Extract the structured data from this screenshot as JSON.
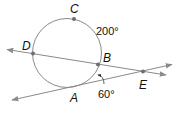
{
  "diagram": {
    "type": "circle with secant and tangent lines",
    "points": {
      "A": {
        "label": "A",
        "role": "tangent point"
      },
      "B": {
        "label": "B",
        "role": "secant intersection"
      },
      "C": {
        "label": "C",
        "role": "point on major arc"
      },
      "D": {
        "label": "D",
        "role": "secant intersection"
      },
      "E": {
        "label": "E",
        "role": "external intersection point"
      }
    },
    "measures": {
      "arc_DCB": "200°",
      "angle_at_A": "60°"
    },
    "colors": {
      "stroke": "#8a8a8a",
      "point": "#6e6e6e",
      "text": "#111111"
    }
  }
}
